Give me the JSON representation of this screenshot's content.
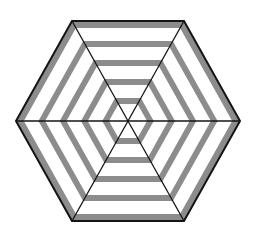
{
  "figure": {
    "type": "striped-hexagon-pattern",
    "center": [
      128,
      121
    ],
    "outer_apothem": 100,
    "horizontal_radius": 112,
    "colors": {
      "background": "#ffffff",
      "band": "#8c8c8c",
      "line": "#141414",
      "fill": "#ffffff"
    },
    "gray_bands": [
      {
        "inner": 93,
        "outer": 100
      },
      {
        "inner": 74,
        "outer": 80
      },
      {
        "inner": 55,
        "outer": 61
      },
      {
        "inner": 36,
        "outer": 42
      },
      {
        "inner": 17,
        "outer": 23
      }
    ],
    "spokes": 3,
    "outline_width": 2
  }
}
